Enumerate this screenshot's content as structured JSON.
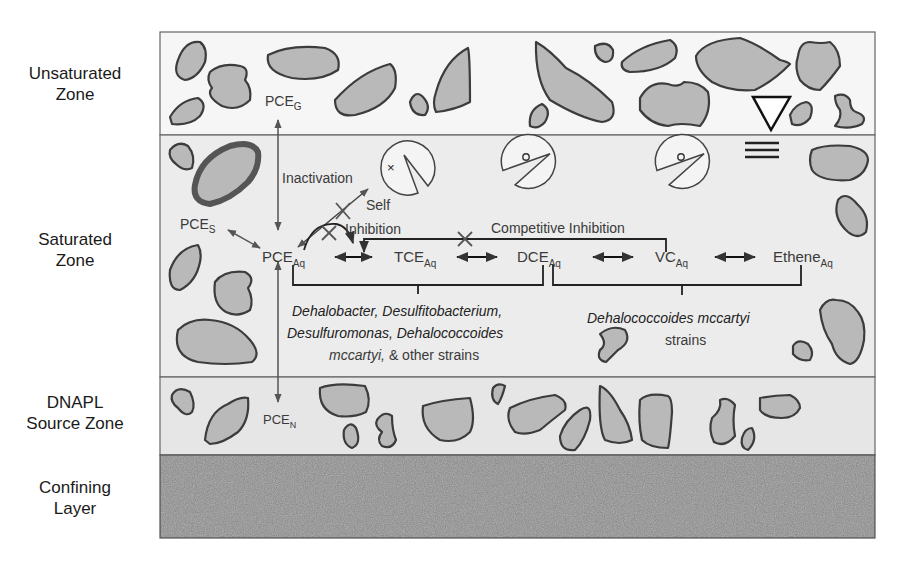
{
  "zones": [
    {
      "id": "unsaturated",
      "line1": "Unsaturated",
      "line2": "Zone"
    },
    {
      "id": "saturated",
      "line1": "Saturated",
      "line2": "Zone"
    },
    {
      "id": "dnapl",
      "line1": "DNAPL",
      "line2": "Source Zone"
    },
    {
      "id": "confining",
      "line1": "Confining",
      "line2": "Layer"
    }
  ],
  "species": {
    "pce_g": {
      "base": "PCE",
      "sub": "G"
    },
    "pce_s": {
      "base": "PCE",
      "sub": "S"
    },
    "pce_n": {
      "base": "PCE",
      "sub": "N"
    },
    "pce_aq": {
      "base": "PCE",
      "sub": "Aq"
    },
    "tce_aq": {
      "base": "TCE",
      "sub": "Aq"
    },
    "dce_aq": {
      "base": "DCE",
      "sub": "Aq"
    },
    "vc_aq": {
      "base": "VC",
      "sub": "Aq"
    },
    "ethene_aq": {
      "base": "Ethene",
      "sub": "Aq"
    }
  },
  "annotations": {
    "inactivation": "Inactivation",
    "self_inhibition_1": "Self",
    "self_inhibition_2": "Inhibition",
    "competitive_inhibition": "Competitive Inhibition"
  },
  "organisms": {
    "group1_line1": "Dehalobacter, Desulfitobacterium,",
    "group1_line2": "Desulfuromonas, Dehalococcoides",
    "group1_line3_italic": "mccartyi,",
    "group1_line3_rest": " & other strains",
    "group2_line1": "Dehalococcoides mccartyi",
    "group2_line2": "strains"
  },
  "colors": {
    "grain_fill": "#b9b9b9",
    "grain_stroke": "#3c3c3c",
    "unsat_bg": "#f6f6f6",
    "sat_bg": "#ececec",
    "dnapl_bg": "#e6e6e6",
    "confining_bg": "#8a8a8a"
  }
}
